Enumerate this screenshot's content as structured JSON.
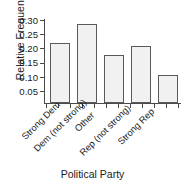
{
  "chart_data": {
    "type": "bar",
    "title": "",
    "subtitle": "",
    "xlabel": "Political Party",
    "ylabel": "Relative Frequency",
    "categories": [
      "Strong Dem",
      "Dem (not strong)",
      "Other",
      "Rep (not strong)",
      "Strong Rep"
    ],
    "values": [
      0.205,
      0.27,
      0.163,
      0.196,
      0.096
    ],
    "ylim": [
      0.0,
      0.305
    ],
    "yticks": [
      0.05,
      0.1,
      0.15,
      0.2,
      0.25,
      0.3
    ],
    "ytick_labels": [
      "0.05",
      "0.10",
      "0.15",
      "0.20",
      "0.25",
      "0.30"
    ],
    "grid": false,
    "legend": null,
    "bar_fill_color": "#f1f1f1",
    "bar_edge_color": "#5a5a5a",
    "axis_color": "#4a4a4a",
    "text_color": "#1a1a1a",
    "background_color": "#ffffff"
  }
}
